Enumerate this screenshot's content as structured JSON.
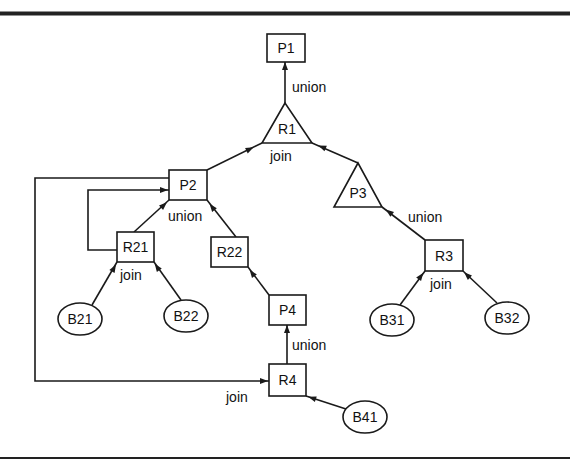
{
  "diagram": {
    "type": "query-tree",
    "nodes": [
      {
        "id": "P1",
        "label": "P1",
        "shape": "rect",
        "x": 267,
        "y": 34,
        "w": 38,
        "h": 28
      },
      {
        "id": "R1",
        "label": "R1",
        "shape": "triangle",
        "points": [
          [
            285,
            103
          ],
          [
            262,
            143
          ],
          [
            312,
            143
          ]
        ],
        "lx": 287,
        "ly": 129
      },
      {
        "id": "P2",
        "label": "P2",
        "shape": "rect",
        "x": 169,
        "y": 170,
        "w": 38,
        "h": 30
      },
      {
        "id": "P3",
        "label": "P3",
        "shape": "triangle",
        "points": [
          [
            358,
            163
          ],
          [
            334,
            207
          ],
          [
            382,
            207
          ]
        ],
        "lx": 358,
        "ly": 193
      },
      {
        "id": "R21",
        "label": "R21",
        "shape": "rect",
        "x": 117,
        "y": 232,
        "w": 37,
        "h": 30
      },
      {
        "id": "R22",
        "label": "R22",
        "shape": "rect",
        "x": 211,
        "y": 237,
        "w": 37,
        "h": 30
      },
      {
        "id": "R3",
        "label": "R3",
        "shape": "rect",
        "x": 425,
        "y": 240,
        "w": 38,
        "h": 31
      },
      {
        "id": "P4",
        "label": "P4",
        "shape": "rect",
        "x": 269,
        "y": 295,
        "w": 37,
        "h": 30
      },
      {
        "id": "R4",
        "label": "R4",
        "shape": "rect",
        "x": 269,
        "y": 364,
        "w": 37,
        "h": 32
      },
      {
        "id": "B21",
        "label": "B21",
        "shape": "ellipse",
        "cx": 80,
        "cy": 319,
        "rx": 22,
        "ry": 16
      },
      {
        "id": "B22",
        "label": "B22",
        "shape": "ellipse",
        "cx": 186,
        "cy": 316,
        "rx": 22,
        "ry": 16
      },
      {
        "id": "B31",
        "label": "B31",
        "shape": "ellipse",
        "cx": 392,
        "cy": 320,
        "rx": 22,
        "ry": 16
      },
      {
        "id": "B32",
        "label": "B32",
        "shape": "ellipse",
        "cx": 507,
        "cy": 318,
        "rx": 22,
        "ry": 16
      },
      {
        "id": "B41",
        "label": "B41",
        "shape": "ellipse",
        "cx": 365,
        "cy": 417,
        "rx": 22,
        "ry": 16
      }
    ],
    "edges": [
      {
        "from": "R1",
        "to": "P1",
        "path": [
          [
            285,
            103
          ],
          [
            285,
            62
          ]
        ],
        "arrow_at": [
          285,
          66
        ]
      },
      {
        "from": "P2",
        "to": "R1",
        "path": [
          [
            207,
            170
          ],
          [
            262,
            143
          ]
        ],
        "arrow_at": [
          250,
          149
        ]
      },
      {
        "from": "P3",
        "to": "R1",
        "path": [
          [
            358,
            163
          ],
          [
            312,
            143
          ]
        ],
        "arrow_at": [
          322,
          147
        ]
      },
      {
        "from": "R21",
        "to": "P2",
        "path": [
          [
            134,
            232
          ],
          [
            169,
            200
          ]
        ],
        "arrow_at": [
          164,
          205
        ]
      },
      {
        "from": "R22",
        "to": "P2",
        "path": [
          [
            236,
            237
          ],
          [
            207,
            200
          ]
        ],
        "arrow_at": [
          212,
          207
        ]
      },
      {
        "from": "R3",
        "to": "P3",
        "path": [
          [
            425,
            240
          ],
          [
            382,
            207
          ]
        ],
        "arrow_at": [
          389,
          212
        ]
      },
      {
        "from": "B21",
        "to": "R21",
        "path": [
          [
            92,
            305
          ],
          [
            117,
            262
          ]
        ],
        "arrow_at": [
          114,
          268
        ]
      },
      {
        "from": "B22",
        "to": "R21",
        "path": [
          [
            181,
            300
          ],
          [
            154,
            262
          ]
        ],
        "arrow_at": [
          157,
          267
        ]
      },
      {
        "from": "P4",
        "to": "R22",
        "path": [
          [
            269,
            295
          ],
          [
            248,
            267
          ]
        ],
        "arrow_at": [
          252,
          273
        ]
      },
      {
        "from": "R4",
        "to": "P4",
        "path": [
          [
            287,
            364
          ],
          [
            287,
            325
          ]
        ],
        "arrow_at": [
          287,
          329
        ]
      },
      {
        "from": "B41",
        "to": "R4",
        "path": [
          [
            346,
            409
          ],
          [
            306,
            396
          ]
        ],
        "arrow_at": [
          312,
          398
        ]
      },
      {
        "from": "B31",
        "to": "R3",
        "path": [
          [
            400,
            305
          ],
          [
            425,
            271
          ]
        ],
        "arrow_at": [
          421,
          276
        ]
      },
      {
        "from": "B32",
        "to": "R3",
        "path": [
          [
            497,
            303
          ],
          [
            463,
            271
          ]
        ],
        "arrow_at": [
          467,
          275
        ]
      },
      {
        "from": "P2",
        "to": "R4",
        "path": [
          [
            169,
            178
          ],
          [
            35,
            178
          ],
          [
            35,
            381
          ],
          [
            269,
            381
          ]
        ],
        "arrow_at": [
          264,
          381
        ]
      },
      {
        "from": "R21",
        "to": "P2",
        "path": [
          [
            117,
            250
          ],
          [
            88,
            250
          ],
          [
            88,
            190
          ],
          [
            169,
            190
          ]
        ],
        "arrow_at": [
          164,
          190
        ]
      }
    ],
    "edge_labels": [
      {
        "text": "union",
        "x": 292,
        "y": 87
      },
      {
        "text": "join",
        "x": 270,
        "y": 156
      },
      {
        "text": "union",
        "x": 168,
        "y": 216
      },
      {
        "text": "join",
        "x": 120,
        "y": 275
      },
      {
        "text": "union",
        "x": 408,
        "y": 217
      },
      {
        "text": "join",
        "x": 430,
        "y": 284
      },
      {
        "text": "union",
        "x": 292,
        "y": 345
      },
      {
        "text": "join",
        "x": 226,
        "y": 397
      }
    ],
    "frame": {
      "top_y": 13.5,
      "top_width": 4,
      "bottom_y": 458,
      "bottom_width": 2,
      "color": "#222222"
    }
  }
}
